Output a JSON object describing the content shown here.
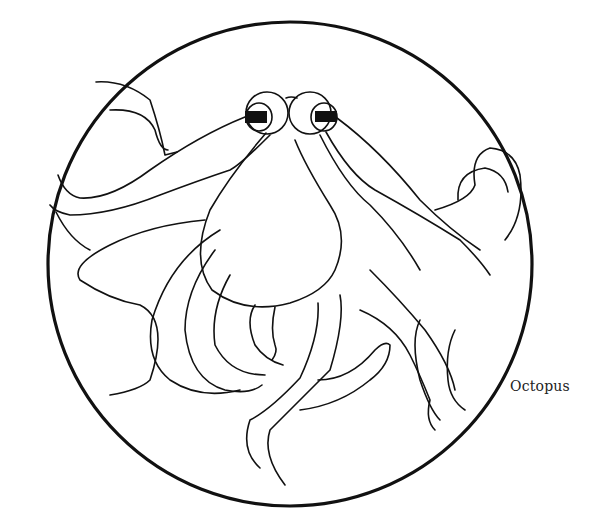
{
  "illustration": {
    "subject": "octopus",
    "style": "line-art coloring page in circular frame",
    "caption": "Octopus",
    "line_color": "#111111",
    "background_color": "#ffffff"
  }
}
